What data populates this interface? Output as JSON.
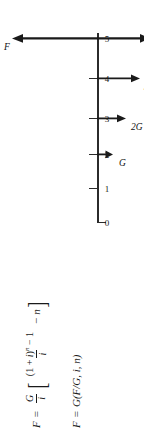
{
  "diagram": {
    "name": "uniform-gradient-future-worth-cash-flow-diagram",
    "orientation": "rotated-90-ccw",
    "axis": {
      "label": "time-axis",
      "ticks": [
        "0",
        "1",
        "2",
        "3",
        "4",
        "5"
      ]
    },
    "flows": [
      {
        "period": "2",
        "label": "G",
        "direction": "down",
        "magnitude": 1
      },
      {
        "period": "3",
        "label": "2G",
        "direction": "down",
        "magnitude": 2
      },
      {
        "period": "4",
        "label": "3G",
        "direction": "down",
        "magnitude": 3
      },
      {
        "period": "5",
        "label": "4G",
        "direction": "down",
        "magnitude": 4
      },
      {
        "period": "5",
        "label": "F",
        "direction": "up",
        "magnitude": 5
      }
    ],
    "colors": {
      "ink": "#2b2b2b",
      "background": "#ffffff"
    }
  },
  "formulas": {
    "line1": {
      "lhs": "F",
      "equals": "=",
      "coef_num": "G",
      "coef_den": "i",
      "bracket_open": "[",
      "frac_num_open": "(1 + ",
      "frac_num_i": "i",
      "frac_num_pow": "n",
      "frac_num_close": ")",
      "frac_num_tail": " − 1",
      "frac_den": "i",
      "minus": "−",
      "n": "n",
      "bracket_close": "]",
      "plain": "F = G/i [ ((1 + i)^n − 1)/i − n ]"
    },
    "line2": {
      "lhs": "F",
      "equals": "=",
      "rhs": "G(F/G, i, n)",
      "plain": "F = G(F/G, i, n)"
    }
  }
}
